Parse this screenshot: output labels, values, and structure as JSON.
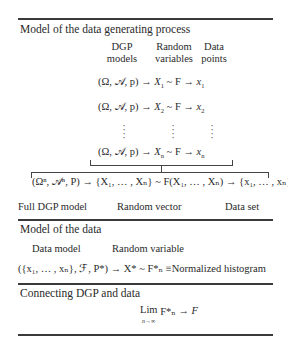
{
  "sections": [
    {
      "title": "Model of the data generating process",
      "column_headers": [
        {
          "line1": "DGP",
          "line2": "models"
        },
        {
          "line1": "Random",
          "line2": "variables"
        },
        {
          "line1": "Data",
          "line2": "points"
        }
      ],
      "rows": [
        {
          "space": "(Ω, 𝒜, p)",
          "arrow1": "→",
          "rv": "X",
          "rv_sub": "1",
          "dist": "~ F",
          "arrow2": "→",
          "pt": "x",
          "pt_sub": "1"
        },
        {
          "space": "(Ω, 𝒜, p)",
          "arrow1": "→",
          "rv": "X",
          "rv_sub": "2",
          "dist": "~ F",
          "arrow2": "→",
          "pt": "x",
          "pt_sub": "2"
        },
        {
          "space": "(Ω, 𝒜, p)",
          "arrow1": "→",
          "rv": "X",
          "rv_sub": "n",
          "dist": "~ F",
          "arrow2": "→",
          "pt": "x",
          "pt_sub": "n"
        }
      ],
      "vdots": "⋮",
      "full_model_equation": {
        "space": "(Ωⁿ, 𝒜ⁿ, P)",
        "arrow1": "→",
        "vector": "{X₁, … , Xₙ}",
        "dist": "~ F(X₁, … , Xₙ)",
        "arrow2": "→",
        "dataset": "{x₁, … , xₙ}"
      },
      "bottom_labels": [
        "Full DGP model",
        "Random vector",
        "Data set"
      ]
    },
    {
      "title": "Model of the data",
      "column_headers": [
        "Data model",
        "Random variable"
      ],
      "equation": {
        "model": "({x₁, … , xₙ}, ℱ, P*)",
        "arrow": "→",
        "rv": "X* ~ F*ₙ",
        "equiv": "≡",
        "desc": "Normalized histogram"
      }
    },
    {
      "title": "Connecting DGP and data",
      "equation": {
        "lim": "Lim",
        "lim_sub": "n→∞",
        "expr": "F*ₙ",
        "arrow": "→",
        "target": "F"
      }
    }
  ]
}
